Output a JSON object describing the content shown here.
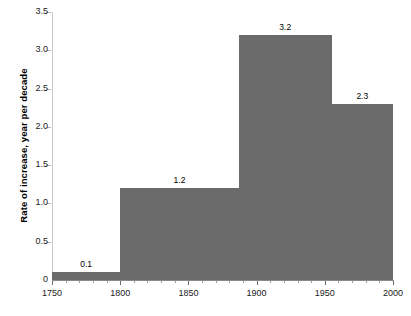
{
  "chart_data": {
    "type": "bar",
    "title": "",
    "xlabel": "",
    "ylabel": "Rate of increase, year per decade",
    "xlim": [
      1750,
      2000
    ],
    "ylim": [
      0,
      3.5
    ],
    "grid": false,
    "legend": null,
    "bar_color": "#6b6b6b",
    "x_ticks": [
      1750,
      1800,
      1850,
      1900,
      1950,
      2000
    ],
    "x_tick_labels": [
      "1750",
      "1800",
      "1850",
      "1900",
      "1950",
      "2000"
    ],
    "x_minor_tick_step": 10,
    "y_ticks": [
      0,
      0.5,
      1.0,
      1.5,
      2.0,
      2.5,
      3.0,
      3.5
    ],
    "y_tick_labels": [
      "0",
      "0.5",
      "1.0",
      "1.5",
      "2.0",
      "2.5",
      "3.0",
      "3.5"
    ],
    "bars": [
      {
        "x_start": 1750,
        "x_end": 1800,
        "value": 0.1,
        "label": "0.1"
      },
      {
        "x_start": 1800,
        "x_end": 1887,
        "value": 1.2,
        "label": "1.2"
      },
      {
        "x_start": 1887,
        "x_end": 1955,
        "value": 3.2,
        "label": "3.2"
      },
      {
        "x_start": 1955,
        "x_end": 2000,
        "value": 2.3,
        "label": "2.3"
      }
    ],
    "categories": [
      "1750-1800",
      "1800-1887",
      "1887-1955",
      "1955-2000"
    ],
    "values": [
      0.1,
      1.2,
      3.2,
      2.3
    ]
  },
  "caption": {
    "text": ""
  }
}
